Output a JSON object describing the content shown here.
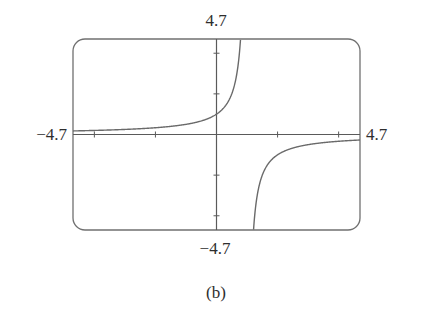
{
  "figure": {
    "caption": "(b)",
    "labels": {
      "ymax": "4.7",
      "ymin": "−4.7",
      "xmin": "−4.7",
      "xmax": "4.7"
    },
    "colors": {
      "frame": "#707070",
      "axes": "#5a5a5a",
      "curve": "#6a6a6a",
      "text": "#2e2e2e"
    }
  },
  "chart_data": {
    "type": "line",
    "title": "",
    "caption": "(b)",
    "xlabel": "",
    "ylabel": "",
    "function": "y = 1/(1 - x)",
    "xlim": [
      -4.7,
      4.7
    ],
    "ylim": [
      -4.7,
      4.7
    ],
    "x_ticks": [
      -4,
      -2,
      2,
      4
    ],
    "y_ticks": [
      -4,
      -2,
      2,
      4
    ],
    "grid": false,
    "legend": null,
    "vertical_asymptote": 1,
    "horizontal_asymptote": 0,
    "series": [
      {
        "name": "left branch",
        "x": [
          -4.7,
          -4,
          -3,
          -2,
          -1,
          0,
          0.25,
          0.5,
          0.65,
          0.75,
          0.787
        ],
        "y": [
          0.175,
          0.2,
          0.25,
          0.333,
          0.5,
          1,
          1.333,
          2,
          2.857,
          4,
          4.7
        ]
      },
      {
        "name": "right branch",
        "x": [
          1.213,
          1.25,
          1.35,
          1.5,
          2,
          3,
          4,
          4.7
        ],
        "y": [
          -4.7,
          -4,
          -2.857,
          -2,
          -1,
          -0.5,
          -0.333,
          -0.27
        ]
      }
    ]
  }
}
